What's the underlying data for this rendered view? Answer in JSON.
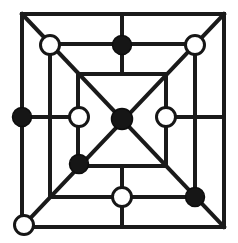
{
  "board": {
    "name": "Nine Men's Morris board",
    "background_color": "#ffffff",
    "line_color": "#1a1a1a",
    "line_width": 4,
    "width": 238,
    "height": 243,
    "squares": [
      {
        "id": "outer-square",
        "x1": 22,
        "y1": 14,
        "x2": 224,
        "y2": 227
      },
      {
        "id": "middle-square",
        "x1": 50,
        "y1": 44,
        "x2": 195,
        "y2": 197
      },
      {
        "id": "inner-square",
        "x1": 78,
        "y1": 74,
        "x2": 166,
        "y2": 166
      }
    ],
    "connectors": [
      {
        "id": "connector-top",
        "x1": 122,
        "y1": 14,
        "x2": 122,
        "y2": 74
      },
      {
        "id": "connector-bottom",
        "x1": 122,
        "y1": 166,
        "x2": 122,
        "y2": 227
      },
      {
        "id": "connector-left",
        "x1": 22,
        "y1": 117,
        "x2": 78,
        "y2": 117
      },
      {
        "id": "connector-right",
        "x1": 166,
        "y1": 117,
        "x2": 224,
        "y2": 117
      }
    ],
    "diagonals": [
      {
        "id": "diagonal-tl-br",
        "x1": 22,
        "y1": 14,
        "x2": 224,
        "y2": 227
      },
      {
        "id": "diagonal-tr-bl",
        "x1": 224,
        "y1": 14,
        "x2": 22,
        "y2": 227
      }
    ]
  },
  "colors": {
    "black_piece_fill": "#161616",
    "white_piece_fill": "#ffffff",
    "piece_stroke": "#161616",
    "line": "#1a1a1a"
  },
  "legend": {
    "black_label": "Black stone",
    "white_label": "White stone",
    "black_count": 6,
    "white_count": 6,
    "total_count": 12
  },
  "pieces": [
    {
      "id": "outer-bottom-left",
      "ring": "outer",
      "point": "bottom-left-corner",
      "color": "white",
      "cx": 24,
      "cy": 225,
      "r": 9.5
    },
    {
      "id": "outer-left-middle",
      "ring": "outer",
      "point": "left-middle",
      "color": "black",
      "cx": 22,
      "cy": 117,
      "r": 9.5
    },
    {
      "id": "middle-top-left",
      "ring": "middle",
      "point": "top-left-corner",
      "color": "white",
      "cx": 50,
      "cy": 45,
      "r": 9.5
    },
    {
      "id": "middle-top-middle",
      "ring": "middle",
      "point": "top-middle",
      "color": "black",
      "cx": 122,
      "cy": 45,
      "r": 9.5
    },
    {
      "id": "middle-top-right",
      "ring": "middle",
      "point": "top-right-corner",
      "color": "white",
      "cx": 195,
      "cy": 45,
      "r": 9.5
    },
    {
      "id": "middle-bottom-middle",
      "ring": "middle",
      "point": "bottom-middle",
      "color": "white",
      "cx": 122,
      "cy": 197,
      "r": 9.5
    },
    {
      "id": "middle-bottom-right",
      "ring": "middle",
      "point": "bottom-right-corner",
      "color": "black",
      "cx": 195,
      "cy": 197,
      "r": 9.5
    },
    {
      "id": "inner-left-middle",
      "ring": "inner",
      "point": "left-middle",
      "color": "white",
      "cx": 79,
      "cy": 117,
      "r": 9.5
    },
    {
      "id": "inner-right-middle",
      "ring": "inner",
      "point": "right-middle",
      "color": "white",
      "cx": 166,
      "cy": 117,
      "r": 9.5
    },
    {
      "id": "inner-bottom-left",
      "ring": "inner",
      "point": "bottom-left-corner",
      "color": "black",
      "cx": 79,
      "cy": 164,
      "r": 9.5
    },
    {
      "id": "center",
      "ring": "center",
      "point": "center",
      "color": "black",
      "cx": 122,
      "cy": 119,
      "r": 10.5
    }
  ]
}
